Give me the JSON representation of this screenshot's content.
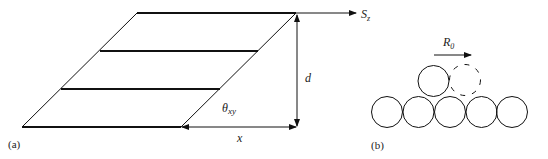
{
  "panel_a": {
    "label": "(a)",
    "sz_label": "S",
    "sz_sub": "z",
    "d_label": "d",
    "x_label": "x",
    "theta_label": "θ",
    "theta_sub": "xy"
  },
  "panel_b": {
    "label": "(b)",
    "r_label": "R",
    "r_sub": "0"
  },
  "colors": {
    "stroke": "#111111",
    "text": "#222222"
  }
}
